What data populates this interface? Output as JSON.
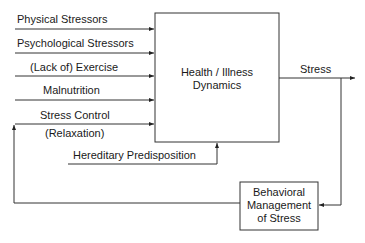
{
  "inputs": [
    {
      "label": "Physical Stressors"
    },
    {
      "label": "Psychological Stressors"
    },
    {
      "label": "(Lack of) Exercise"
    },
    {
      "label": "Malnutrition"
    },
    {
      "label": "Stress Control"
    }
  ],
  "stress_control_sub": "(Relaxation)",
  "hereditary": "Hereditary Predisposition",
  "main_box": {
    "line1": "Health / Illness",
    "line2": "Dynamics"
  },
  "output": "Stress",
  "feedback_box": {
    "line1": "Behavioral",
    "line2": "Management",
    "line3": "of Stress"
  }
}
